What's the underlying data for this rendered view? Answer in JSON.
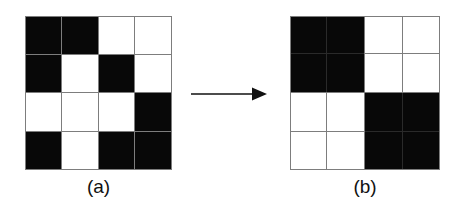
{
  "figure": {
    "background_color": "#ffffff",
    "black_color": "#080808",
    "white_color": "#ffffff",
    "gridline_color": "#7d7d7d"
  },
  "panels": [
    {
      "id": "a",
      "caption": "(a)",
      "kind": "pixel-grid",
      "rows": 4,
      "cols": 4,
      "description": "4 by 4 binary pixel image, 1 = black, 0 = white",
      "cells": [
        [
          1,
          1,
          0,
          0
        ],
        [
          1,
          0,
          1,
          0
        ],
        [
          0,
          0,
          0,
          1
        ],
        [
          1,
          0,
          1,
          1
        ]
      ]
    },
    {
      "id": "b",
      "caption": "(b)",
      "kind": "quadtree-grid",
      "rows": 2,
      "cols": 2,
      "description": "Quadtree blocks: uniform quadrants are merged, mixed quadrants are split into 2 by 2 sub-blocks",
      "quadrants": [
        {
          "position": "top-left",
          "value": 1,
          "color": "black",
          "subdivided": true
        },
        {
          "position": "top-right",
          "value": 0,
          "color": "white",
          "subdivided": true
        },
        {
          "position": "bottom-left",
          "value": 0,
          "color": "white",
          "subdivided": true
        },
        {
          "position": "bottom-right",
          "value": 1,
          "color": "black",
          "subdivided": true
        }
      ]
    }
  ],
  "arrow": {
    "name": "right-arrow",
    "direction": "right",
    "color": "#111111"
  }
}
